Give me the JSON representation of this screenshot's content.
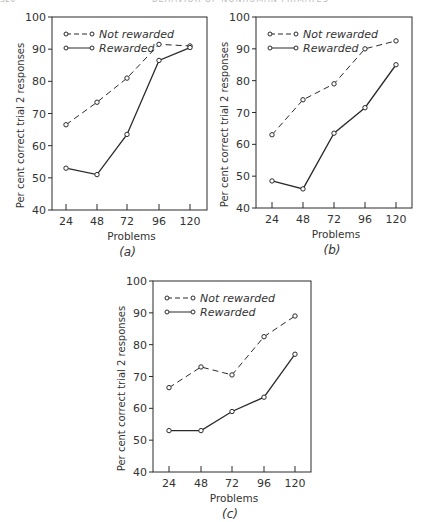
{
  "page_header": {
    "page_number": "320",
    "running_title": "BEHAVIOR OF NONHUMAN PRIMATES"
  },
  "chart_data": [
    {
      "type": "line",
      "panel_label": "(a)",
      "title": "",
      "xlabel": "Problems",
      "ylabel": "Per cent correct trial 2 responses",
      "x": [
        24,
        48,
        72,
        96,
        120
      ],
      "xticks": [
        "24",
        "48",
        "72",
        "96",
        "120"
      ],
      "yticks": [
        "40",
        "50",
        "60",
        "70",
        "80",
        "90",
        "100"
      ],
      "ylim": [
        40,
        100
      ],
      "grid": false,
      "legend_position": "upper left",
      "series": [
        {
          "name": "Not rewarded",
          "style": "dashed",
          "marker": "open-circle",
          "values": [
            66.5,
            73.5,
            81,
            91.5,
            91
          ]
        },
        {
          "name": "Rewarded",
          "style": "solid",
          "marker": "open-circle",
          "values": [
            53,
            51,
            63.5,
            86.5,
            90.5
          ]
        }
      ]
    },
    {
      "type": "line",
      "panel_label": "(b)",
      "title": "",
      "xlabel": "Problems",
      "ylabel": "Per cent correct trial 2 responses",
      "x": [
        24,
        48,
        72,
        96,
        120
      ],
      "xticks": [
        "24",
        "48",
        "72",
        "96",
        "120"
      ],
      "yticks": [
        "40",
        "50",
        "60",
        "70",
        "80",
        "90",
        "100"
      ],
      "ylim": [
        40,
        100
      ],
      "grid": false,
      "legend_position": "upper left",
      "series": [
        {
          "name": "Not rewarded",
          "style": "dashed",
          "marker": "open-circle",
          "values": [
            63,
            74,
            79,
            90,
            92.5
          ]
        },
        {
          "name": "Rewarded",
          "style": "solid",
          "marker": "open-circle",
          "values": [
            48.5,
            46,
            63.5,
            71.5,
            85
          ]
        }
      ]
    },
    {
      "type": "line",
      "panel_label": "(c)",
      "title": "",
      "xlabel": "Problems",
      "ylabel": "Per cent correct trial 2 responses",
      "x": [
        24,
        48,
        72,
        96,
        120
      ],
      "xticks": [
        "24",
        "48",
        "72",
        "96",
        "120"
      ],
      "yticks": [
        "40",
        "50",
        "60",
        "70",
        "80",
        "90",
        "100"
      ],
      "ylim": [
        40,
        100
      ],
      "grid": false,
      "legend_position": "upper left",
      "series": [
        {
          "name": "Not rewarded",
          "style": "dashed",
          "marker": "open-circle",
          "values": [
            66.5,
            73,
            70.5,
            82.5,
            89
          ]
        },
        {
          "name": "Rewarded",
          "style": "solid",
          "marker": "open-circle",
          "values": [
            53,
            53,
            59,
            63.5,
            77
          ]
        }
      ]
    }
  ],
  "layout": {
    "panels": [
      {
        "left": 52,
        "right": 207,
        "top": 17,
        "bottom": 210,
        "tick_x": [
          66,
          97,
          127,
          159,
          190
        ]
      },
      {
        "left": 256,
        "right": 412,
        "top": 17,
        "bottom": 208,
        "tick_x": [
          272,
          303,
          334,
          365,
          396
        ]
      },
      {
        "left": 153,
        "right": 311,
        "top": 281,
        "bottom": 472,
        "tick_x": [
          169,
          201,
          232,
          264,
          295
        ]
      }
    ],
    "line_color": "#2a2a2a"
  }
}
